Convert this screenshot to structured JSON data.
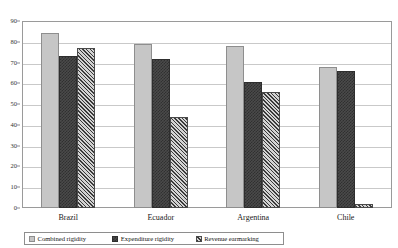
{
  "chart_data": {
    "type": "bar",
    "title": "",
    "xlabel": "",
    "ylabel": "",
    "ylim": [
      0,
      90
    ],
    "ytick_step": 10,
    "yticks": [
      "90",
      "80",
      "70",
      "60",
      "50",
      "40",
      "30",
      "20",
      "10",
      "0"
    ],
    "grid": true,
    "legend_position": "bottom",
    "categories": [
      "Brazil",
      "Ecuador",
      "Argentina",
      "Chile"
    ],
    "series": [
      {
        "name": "Combined rigidity",
        "values": [
          84,
          79,
          78,
          68
        ]
      },
      {
        "name": "Expenditure rigidity",
        "values": [
          73,
          71.5,
          60.5,
          66
        ]
      },
      {
        "name": "Revenue earmarking",
        "values": [
          77,
          44,
          56,
          2
        ]
      }
    ]
  },
  "legend": {
    "items": [
      {
        "label": "Combined rigidity",
        "swatch": "legend-swatch-combined-rigidity"
      },
      {
        "label": "Expenditure rigidity",
        "swatch": "legend-swatch-expenditure-rigidity"
      },
      {
        "label": "Revenue earmarking",
        "swatch": "legend-swatch-revenue-earmarking"
      }
    ]
  },
  "colors": {
    "series0": "#c6c6c6",
    "series1": "#4a4a4a",
    "series2": "#8f8f8f",
    "gridline": "#c9c9c9",
    "axis": "#9a9a9a"
  }
}
